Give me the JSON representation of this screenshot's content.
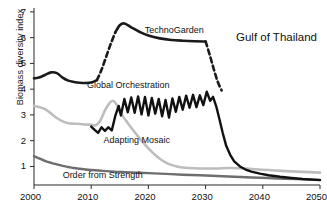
{
  "chart_data": {
    "type": "line",
    "title": "Gulf of Thailand",
    "xlabel": "",
    "ylabel": "Biomass diversity index",
    "xlim": [
      2000,
      2050
    ],
    "ylim": [
      0.28,
      7.15
    ],
    "xticks": [
      2000,
      2010,
      2020,
      2030,
      2040,
      2050
    ],
    "xticklabels": [
      "2000",
      "2010",
      "2020",
      "2030",
      "2040",
      "2050"
    ],
    "yticks": [
      1,
      2,
      3,
      4,
      5,
      6,
      7
    ],
    "yticklabels": [
      "1",
      "2",
      "3",
      "4",
      "5",
      "6",
      "7"
    ],
    "grid": false,
    "legend_position": "inline-annotations",
    "series": [
      {
        "name": "TechnoGarden",
        "color": "#1a1a1a",
        "width": 2.6,
        "label_x": 2024.5,
        "label_y": 6.25,
        "segments": [
          {
            "style": "solid",
            "points": [
              [
                2000,
                4.42
              ],
              [
                2001,
                4.46
              ],
              [
                2002,
                4.56
              ],
              [
                2003,
                4.65
              ],
              [
                2004,
                4.62
              ],
              [
                2005,
                4.45
              ],
              [
                2006,
                4.33
              ],
              [
                2007,
                4.28
              ],
              [
                2008,
                4.25
              ],
              [
                2009,
                4.24
              ],
              [
                2010,
                4.26
              ],
              [
                2011,
                4.35
              ]
            ]
          },
          {
            "style": "dashed",
            "points": [
              [
                2011,
                4.35
              ],
              [
                2011.8,
                4.75
              ],
              [
                2012.6,
                5.25
              ],
              [
                2013.4,
                5.75
              ],
              [
                2014.2,
                6.2
              ]
            ]
          },
          {
            "style": "solid",
            "points": [
              [
                2014.2,
                6.2
              ],
              [
                2015,
                6.48
              ],
              [
                2015.8,
                6.55
              ],
              [
                2017,
                6.4
              ],
              [
                2018.5,
                6.22
              ],
              [
                2020,
                6.08
              ],
              [
                2022,
                5.97
              ],
              [
                2024,
                5.91
              ],
              [
                2026,
                5.88
              ],
              [
                2028,
                5.86
              ],
              [
                2030,
                5.85
              ]
            ]
          },
          {
            "style": "dashed",
            "points": [
              [
                2030,
                5.85
              ],
              [
                2030.7,
                5.35
              ],
              [
                2031.4,
                4.8
              ],
              [
                2032.1,
                4.3
              ],
              [
                2032.8,
                3.95
              ]
            ]
          }
        ]
      },
      {
        "name": "Global Orchestration",
        "color": "#111111",
        "width": 2.4,
        "label_x": 2016.5,
        "label_y": 4.12,
        "segments": [
          {
            "style": "solid",
            "points": [
              [
                2010,
                2.55
              ],
              [
                2010.6,
                2.42
              ],
              [
                2011.2,
                2.3
              ],
              [
                2011.8,
                2.52
              ],
              [
                2012.4,
                2.38
              ],
              [
                2013,
                2.52
              ],
              [
                2013.6,
                2.4
              ],
              [
                2014.2,
                2.95
              ],
              [
                2014.8,
                3.35
              ],
              [
                2015.2,
                2.98
              ],
              [
                2015.8,
                3.62
              ],
              [
                2016.4,
                3.1
              ],
              [
                2017,
                3.68
              ],
              [
                2017.6,
                3.08
              ],
              [
                2018.2,
                3.72
              ],
              [
                2018.8,
                3.02
              ],
              [
                2019.4,
                3.7
              ],
              [
                2020,
                2.98
              ],
              [
                2020.6,
                3.66
              ],
              [
                2021.2,
                3.05
              ],
              [
                2021.8,
                3.62
              ],
              [
                2022.4,
                2.95
              ],
              [
                2023,
                3.58
              ],
              [
                2023.6,
                2.9
              ],
              [
                2024.2,
                3.64
              ],
              [
                2024.8,
                3.12
              ],
              [
                2025.4,
                3.7
              ],
              [
                2026,
                3.2
              ],
              [
                2026.6,
                3.75
              ],
              [
                2027.2,
                3.28
              ],
              [
                2027.8,
                3.78
              ],
              [
                2028.4,
                3.3
              ],
              [
                2029,
                3.76
              ],
              [
                2029.6,
                3.38
              ],
              [
                2030.2,
                3.9
              ],
              [
                2030.8,
                3.55
              ],
              [
                2031.3,
                3.7
              ],
              [
                2031.9,
                3.3
              ],
              [
                2032.4,
                2.85
              ],
              [
                2033,
                2.3
              ],
              [
                2033.6,
                1.8
              ],
              [
                2034.3,
                1.45
              ],
              [
                2035,
                1.2
              ],
              [
                2036,
                1.0
              ],
              [
                2037,
                0.88
              ],
              [
                2038,
                0.8
              ],
              [
                2039.5,
                0.72
              ],
              [
                2041,
                0.66
              ],
              [
                2043,
                0.6
              ],
              [
                2045,
                0.55
              ],
              [
                2047,
                0.51
              ],
              [
                2050,
                0.47
              ]
            ]
          }
        ]
      },
      {
        "name": "Adapting Mosaic",
        "color": "#bdbdbd",
        "width": 2.6,
        "label_x": 2018.0,
        "label_y": 2.0,
        "segments": [
          {
            "style": "solid",
            "points": [
              [
                2000,
                3.35
              ],
              [
                2001,
                3.3
              ],
              [
                2002,
                3.22
              ],
              [
                2003,
                3.05
              ],
              [
                2004,
                2.88
              ],
              [
                2005,
                2.75
              ],
              [
                2006,
                2.68
              ],
              [
                2007,
                2.66
              ],
              [
                2008,
                2.65
              ],
              [
                2009,
                2.63
              ],
              [
                2010,
                2.62
              ],
              [
                2010.8,
                2.6
              ],
              [
                2011.6,
                2.78
              ],
              [
                2012.4,
                3.18
              ],
              [
                2013.2,
                3.46
              ],
              [
                2013.8,
                3.55
              ],
              [
                2014.4,
                3.42
              ],
              [
                2015,
                3.12
              ],
              [
                2016,
                2.8
              ],
              [
                2017,
                2.5
              ],
              [
                2018,
                2.22
              ],
              [
                2019,
                1.95
              ],
              [
                2020,
                1.7
              ],
              [
                2021,
                1.48
              ],
              [
                2022,
                1.3
              ],
              [
                2023,
                1.16
              ],
              [
                2024,
                1.06
              ],
              [
                2025,
                1.0
              ],
              [
                2026,
                0.96
              ],
              [
                2028,
                0.93
              ],
              [
                2030,
                0.92
              ],
              [
                2032,
                0.92
              ],
              [
                2034,
                0.94
              ],
              [
                2036,
                0.93
              ],
              [
                2038,
                0.9
              ],
              [
                2041,
                0.86
              ],
              [
                2044,
                0.82
              ],
              [
                2047,
                0.79
              ],
              [
                2050,
                0.76
              ]
            ]
          }
        ]
      },
      {
        "name": "Order from Strength",
        "color": "#6e6e6e",
        "width": 2.4,
        "label_x": 2012.0,
        "label_y": 0.62,
        "segments": [
          {
            "style": "solid",
            "points": [
              [
                2000,
                1.4
              ],
              [
                2001,
                1.3
              ],
              [
                2002,
                1.21
              ],
              [
                2003,
                1.14
              ],
              [
                2004,
                1.08
              ],
              [
                2005,
                1.02
              ],
              [
                2006,
                0.98
              ],
              [
                2007,
                0.94
              ],
              [
                2008,
                0.91
              ],
              [
                2009,
                0.88
              ],
              [
                2010,
                0.86
              ],
              [
                2012,
                0.83
              ],
              [
                2014,
                0.8
              ],
              [
                2016,
                0.78
              ],
              [
                2018,
                0.76
              ],
              [
                2020,
                0.74
              ],
              [
                2023,
                0.71
              ],
              [
                2026,
                0.68
              ],
              [
                2029,
                0.66
              ],
              [
                2032,
                0.63
              ],
              [
                2035,
                0.6
              ],
              [
                2038,
                0.57
              ],
              [
                2041,
                0.55
              ],
              [
                2044,
                0.52
              ],
              [
                2047,
                0.5
              ],
              [
                2050,
                0.48
              ]
            ]
          }
        ]
      }
    ]
  }
}
